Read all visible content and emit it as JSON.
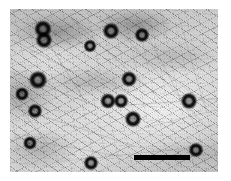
{
  "figure": {
    "kind": "electron-micrograph",
    "modality": "transmission electron microscopy (negative stain)",
    "caption": "",
    "canvas": {
      "width": 231,
      "height": 181,
      "background": "#ffffff"
    }
  },
  "micrograph": {
    "x": 10,
    "y": 9,
    "width": 208,
    "height": 163,
    "background_tone": "#d8d8d8",
    "dark_tone": "#3c3c3c",
    "description": "Dense fibrillar meshwork background with numerous dark ring-shaped particles distributed across the field"
  },
  "scale_bar": {
    "label": "",
    "x": 134,
    "y": 155,
    "width": 56,
    "height": 5,
    "color": "#000000"
  },
  "particles": [
    {
      "cx": 43,
      "cy": 29,
      "r": 9.5
    },
    {
      "cx": 44,
      "cy": 40,
      "r": 9.0
    },
    {
      "cx": 90,
      "cy": 46,
      "r": 7.0
    },
    {
      "cx": 111,
      "cy": 31,
      "r": 9.0
    },
    {
      "cx": 142,
      "cy": 35,
      "r": 8.0
    },
    {
      "cx": 38,
      "cy": 80,
      "r": 10.0
    },
    {
      "cx": 22,
      "cy": 94,
      "r": 7.5
    },
    {
      "cx": 35,
      "cy": 111,
      "r": 8.0
    },
    {
      "cx": 129,
      "cy": 79,
      "r": 8.5
    },
    {
      "cx": 108,
      "cy": 101,
      "r": 8.5
    },
    {
      "cx": 121,
      "cy": 101,
      "r": 8.0
    },
    {
      "cx": 133,
      "cy": 119,
      "r": 9.0
    },
    {
      "cx": 189,
      "cy": 101,
      "r": 9.0
    },
    {
      "cx": 30,
      "cy": 143,
      "r": 7.5
    },
    {
      "cx": 91,
      "cy": 163,
      "r": 8.0
    },
    {
      "cx": 196,
      "cy": 150,
      "r": 8.0
    }
  ],
  "filaments": [
    {
      "x": 2,
      "y": 30,
      "len": 70,
      "angle": 28,
      "w": 1.2,
      "o": 0.4
    },
    {
      "x": 0,
      "y": 62,
      "len": 95,
      "angle": 22,
      "w": 1.0,
      "o": 0.34
    },
    {
      "x": 12,
      "y": 100,
      "len": 120,
      "angle": 18,
      "w": 1.1,
      "o": 0.32
    },
    {
      "x": 4,
      "y": 128,
      "len": 110,
      "angle": 10,
      "w": 1.0,
      "o": 0.3
    },
    {
      "x": 60,
      "y": 8,
      "len": 130,
      "angle": 42,
      "w": 1.0,
      "o": 0.32
    },
    {
      "x": 96,
      "y": 6,
      "len": 150,
      "angle": 48,
      "w": 0.9,
      "o": 0.28
    },
    {
      "x": 130,
      "y": 12,
      "len": 120,
      "angle": 62,
      "w": 0.9,
      "o": 0.26
    },
    {
      "x": 168,
      "y": 4,
      "len": 100,
      "angle": 74,
      "w": 0.9,
      "o": 0.24
    },
    {
      "x": 24,
      "y": 10,
      "len": 100,
      "angle": 58,
      "w": 1.0,
      "o": 0.36
    },
    {
      "x": 112,
      "y": 96,
      "len": 96,
      "angle": -4,
      "w": 1.1,
      "o": 0.34
    },
    {
      "x": 136,
      "y": 118,
      "len": 78,
      "angle": -14,
      "w": 0.9,
      "o": 0.26
    },
    {
      "x": 50,
      "y": 152,
      "len": 150,
      "angle": -6,
      "w": 0.9,
      "o": 0.24
    },
    {
      "x": 0,
      "y": 86,
      "len": 60,
      "angle": 52,
      "w": 1.0,
      "o": 0.3
    },
    {
      "x": 150,
      "y": 60,
      "len": 70,
      "angle": 36,
      "w": 0.9,
      "o": 0.22
    },
    {
      "x": 76,
      "y": 60,
      "len": 86,
      "angle": 30,
      "w": 0.9,
      "o": 0.28
    },
    {
      "x": 20,
      "y": 44,
      "len": 88,
      "angle": -20,
      "w": 0.9,
      "o": 0.26
    }
  ]
}
